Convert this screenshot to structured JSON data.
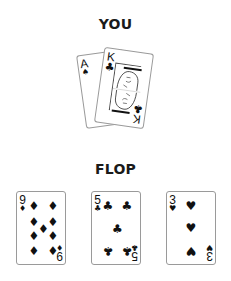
{
  "sections": {
    "you": {
      "title": "YOU",
      "cards": [
        {
          "rank": "A",
          "suit": "♠",
          "suit_name": "spades"
        },
        {
          "rank": "K",
          "suit": "♣",
          "suit_name": "clubs"
        }
      ]
    },
    "flop": {
      "title": "FLOP",
      "cards": [
        {
          "rank": "9",
          "suit": "♦",
          "suit_name": "diamonds"
        },
        {
          "rank": "5",
          "suit": "♣",
          "suit_name": "clubs"
        },
        {
          "rank": "3",
          "suit": "♥",
          "suit_name": "hearts"
        }
      ]
    }
  },
  "colors": {
    "background": "#ffffff",
    "card_border": "#9a9a9a",
    "ink": "#111111"
  }
}
